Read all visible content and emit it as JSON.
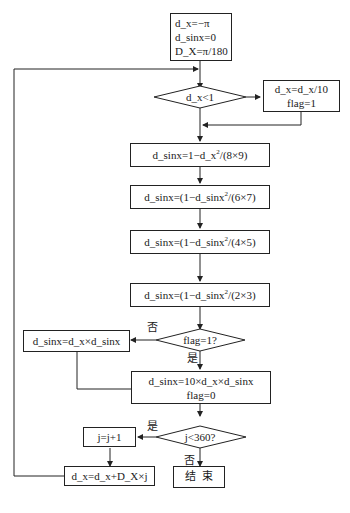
{
  "flowchart": {
    "init": {
      "lines": [
        "d_x=−π",
        "d_sinx=0",
        "D_X=π/180"
      ]
    },
    "cond_dx": {
      "label": "d_x<1"
    },
    "scale_box": {
      "lines": [
        "d_x=d_x/10",
        "flag=1"
      ]
    },
    "step1": {
      "text": "d_sinx=1−d_x²/(8×9)"
    },
    "step2": {
      "text": "d_sinx=(1−d_sinx²/(6×7)"
    },
    "step3": {
      "text": "d_sinx=(1−d_sinx²/(4×5)"
    },
    "step4": {
      "text": "d_sinx=(1−d_sinx²/(2×3)"
    },
    "cond_flag": {
      "label": "flag=1?"
    },
    "no_flag_box": {
      "text": "d_sinx=d_x×d_sinx"
    },
    "yes_flag_box": {
      "lines": [
        "d_sinx=10×d_x×d_sinx",
        "flag=0"
      ]
    },
    "cond_j": {
      "label": "j<360?"
    },
    "inc_j": {
      "text": "j=j+1"
    },
    "update_dx": {
      "text": "d_x=d_x+D_X×j"
    },
    "end": {
      "text": "结  束"
    },
    "branch_labels": {
      "flag_no": "否",
      "flag_yes": "是",
      "j_yes": "是",
      "j_no": "否"
    }
  }
}
